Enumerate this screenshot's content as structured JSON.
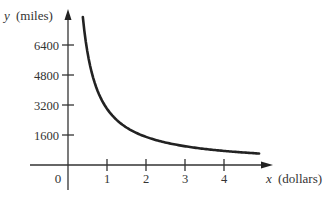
{
  "chart_data": {
    "type": "line",
    "title": "",
    "xlabel_var": "x",
    "xlabel_unit": "(dollars)",
    "ylabel_var": "y",
    "ylabel_unit": "(miles)",
    "x_ticks": [
      1,
      2,
      3,
      4
    ],
    "y_ticks": [
      1600,
      3200,
      4800,
      6400
    ],
    "origin_label": "0",
    "xlim": [
      0,
      5
    ],
    "ylim": [
      0,
      8000
    ],
    "grid": false,
    "series": [
      {
        "name": "y = k/x",
        "function": "y = 3000 / x",
        "x": [
          0.38,
          0.5,
          0.75,
          1,
          1.5,
          2,
          2.5,
          3,
          3.5,
          4,
          4.5,
          4.9
        ],
        "y": [
          7900,
          6000,
          4000,
          3000,
          2000,
          1500,
          1200,
          1000,
          857,
          750,
          667,
          612
        ]
      }
    ],
    "color": "#222222"
  }
}
